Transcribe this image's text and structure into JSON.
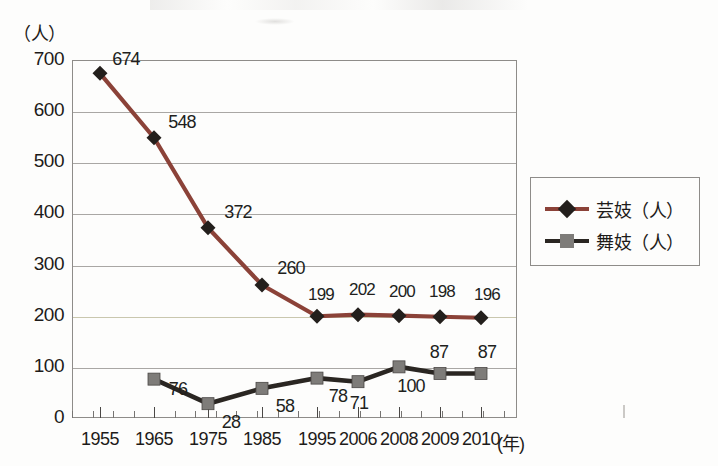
{
  "axes": {
    "y_unit_label": "（人）",
    "x_unit_label": "(年)",
    "y_ticks": [
      "700",
      "600",
      "500",
      "400",
      "300",
      "200",
      "100",
      "0"
    ],
    "x_ticks": [
      "1955",
      "1965",
      "1975",
      "1985",
      "1995",
      "2006",
      "2008",
      "2009",
      "2010"
    ]
  },
  "legend": {
    "items": [
      {
        "label": "芸妓（人）",
        "color": "#8b4238",
        "marker": "diamond"
      },
      {
        "label": "舞妓（人）",
        "color": "#2a2622",
        "marker": "square"
      }
    ]
  },
  "chart_data": {
    "type": "line",
    "title": "",
    "xlabel": "(年)",
    "ylabel": "（人）",
    "ylim": [
      0,
      700
    ],
    "ytick_step": 100,
    "grid": true,
    "legend_position": "right",
    "categories": [
      "1955",
      "1965",
      "1975",
      "1985",
      "1995",
      "2006",
      "2008",
      "2009",
      "2010"
    ],
    "series": [
      {
        "name": "芸妓（人）",
        "color": "#8b4238",
        "marker": "diamond",
        "values": [
          674,
          548,
          372,
          260,
          199,
          202,
          200,
          198,
          196
        ],
        "labels": [
          "674",
          "548",
          "372",
          "260",
          "199",
          "202",
          "200",
          "198",
          "196"
        ]
      },
      {
        "name": "舞妓（人）",
        "color": "#2a2622",
        "marker": "square",
        "values": [
          null,
          76,
          28,
          58,
          78,
          71,
          100,
          87,
          87
        ],
        "labels": [
          "",
          "76",
          "28",
          "58",
          "78",
          "71",
          "100",
          "87",
          "87"
        ]
      }
    ]
  },
  "colors": {
    "geiko_line": "#8b4238",
    "maiko_line": "#2a2622",
    "maiko_marker": "#7e7c79",
    "geiko_marker": "#231f1c",
    "grid": "#a9a7a4",
    "frame": "#8e8c89",
    "paper": "#fdfdfc"
  }
}
